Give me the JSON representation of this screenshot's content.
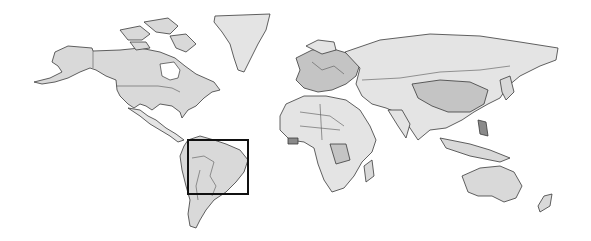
{
  "map": {
    "type": "world-map",
    "projection": "equirectangular",
    "style": "grayscale",
    "colors": {
      "background": "#ffffff",
      "land": "#d9d9d9",
      "land_light": "#e4e4e4",
      "land_mid": "#c4c4c4",
      "land_dark": "#8a8a8a",
      "borders": "#3a3a3a",
      "highlight_box": "#111111"
    },
    "highlight": {
      "label": "South America (Brazil region)",
      "x": 188,
      "y": 140,
      "width": 60,
      "height": 54
    }
  }
}
